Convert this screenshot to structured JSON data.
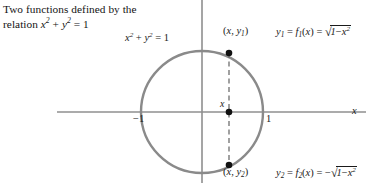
{
  "caption": {
    "line1": "Two functions defined by the",
    "line2_prefix": "relation ",
    "line2_expr": "x² + y² = 1"
  },
  "figure": {
    "type": "unit-circle-diagram",
    "equation_label": "x² + y² = 1",
    "axis_labels": {
      "x_axis": "x",
      "tick_left": "−1",
      "tick_right": "1",
      "point_on_axis": "x"
    },
    "points": [
      {
        "name": "upper-point",
        "label": "(x, y₁)",
        "x": 229,
        "y": 53
      },
      {
        "name": "axis-point",
        "label": "x",
        "x": 229,
        "y": 112
      },
      {
        "name": "lower-point",
        "label": "(x, y₂)",
        "x": 229,
        "y": 165
      }
    ],
    "functions": [
      {
        "name": "f1",
        "label": "y₁ = f₁(x) = √(1 − x²)",
        "lhs": "y₁",
        "rhs": "f₁(x)",
        "expression": "√(1 − x²)",
        "sign": "+"
      },
      {
        "name": "f2",
        "label": "y₂ = f₂(x) = −√(1 − x²)",
        "lhs": "y₂",
        "rhs": "f₂(x)",
        "expression": "−√(1 − x²)",
        "sign": "−"
      }
    ],
    "geometry": {
      "center_x": 202,
      "center_y": 112,
      "radius": 61,
      "dashed_line_x": 229
    },
    "colors": {
      "curve": "#8a8a8a",
      "axis": "#8f8f8f",
      "dashed": "#6f6f6f",
      "dot": "#111111",
      "text": "#1a1a1a"
    }
  }
}
